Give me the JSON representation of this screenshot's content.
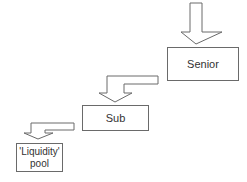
{
  "diagram": {
    "type": "waterfall-flow",
    "nodes": [
      {
        "id": "senior",
        "label": "Senior"
      },
      {
        "id": "sub",
        "label": "Sub"
      },
      {
        "id": "pool",
        "label_line1": "'Liquidity'",
        "label_line2": "pool"
      }
    ],
    "edges": [
      {
        "from": "top",
        "to": "senior",
        "style": "block-arrow-down"
      },
      {
        "from": "senior",
        "to": "sub",
        "style": "block-arrow-bent-down"
      },
      {
        "from": "sub",
        "to": "pool",
        "style": "block-arrow-bent-down"
      }
    ],
    "colors": {
      "stroke": "#6a6a6a",
      "fill": "#ffffff",
      "text": "#333333"
    }
  }
}
